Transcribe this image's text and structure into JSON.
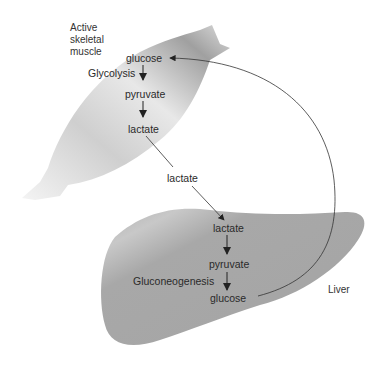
{
  "diagram": {
    "regions": {
      "muscle": {
        "label_lines": [
          "Active",
          "skeletal",
          "muscle"
        ]
      },
      "liver": {
        "label": "Liver"
      }
    },
    "muscle_pathway": {
      "process": "Glycolysis",
      "steps": [
        "glucose",
        "pyruvate",
        "lactate"
      ]
    },
    "transport": {
      "label": "lactate"
    },
    "liver_pathway": {
      "process": "Gluconeogenesis",
      "steps": [
        "lactate",
        "pyruvate",
        "glucose"
      ]
    },
    "colors": {
      "muscle_fill_light": "#f2f2f2",
      "muscle_fill_dark": "#9a9a9a",
      "liver_fill": "#a9a9a9",
      "arrow": "#222222"
    }
  }
}
